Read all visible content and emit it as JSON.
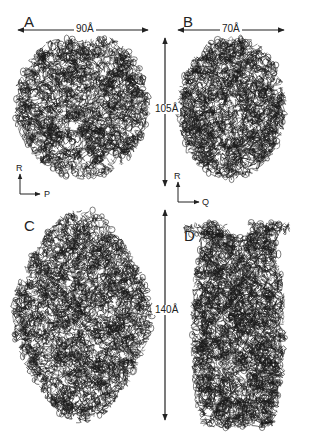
{
  "figure": {
    "panels": [
      {
        "id": "A",
        "label": "A",
        "axis_h": "P",
        "axis_v": "R"
      },
      {
        "id": "B",
        "label": "B",
        "axis_h": "Q",
        "axis_v": "R"
      },
      {
        "id": "C",
        "label": "C"
      },
      {
        "id": "D",
        "label": "D"
      }
    ],
    "dimensions": {
      "width_A": "90Å",
      "width_B": "70Å",
      "height_top": "105Å",
      "height_bottom": "140Å"
    },
    "colors": {
      "ribbon": "#1a1a1a",
      "background": "#ffffff",
      "annotation": "#222222"
    }
  }
}
